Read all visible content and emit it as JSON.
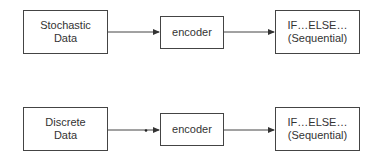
{
  "rows": [
    {
      "source": {
        "line1": "Stochastic",
        "line2": "Data"
      },
      "encoder": {
        "label": "encoder"
      },
      "output": {
        "line1": "IF…ELSE…",
        "line2": "(Sequential)"
      }
    },
    {
      "source": {
        "line1": "Discrete",
        "line2": "Data"
      },
      "encoder": {
        "label": "encoder"
      },
      "output": {
        "line1": "IF…ELSE…",
        "line2": "(Sequential)"
      }
    }
  ],
  "colors": {
    "stroke": "#444444",
    "text": "#333333",
    "background": "#ffffff"
  }
}
